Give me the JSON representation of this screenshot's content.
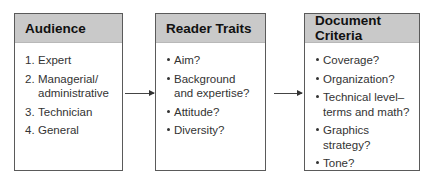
{
  "diagram": {
    "boxes": [
      {
        "title": "Audience",
        "list_type": "numbered",
        "items": [
          {
            "marker": "1.",
            "lines": [
              "Expert"
            ]
          },
          {
            "marker": "2.",
            "lines": [
              "Managerial/",
              "administrative"
            ]
          },
          {
            "marker": "3.",
            "lines": [
              "Technician"
            ]
          },
          {
            "marker": "4.",
            "lines": [
              "General"
            ]
          }
        ]
      },
      {
        "title": "Reader Traits",
        "list_type": "bullet",
        "items": [
          {
            "lines": [
              "Aim?"
            ]
          },
          {
            "lines": [
              "Background",
              "and expertise?"
            ]
          },
          {
            "lines": [
              "Attitude?"
            ]
          },
          {
            "lines": [
              "Diversity?"
            ]
          }
        ]
      },
      {
        "title": "Document Criteria",
        "list_type": "bullet",
        "items": [
          {
            "lines": [
              "Coverage?"
            ]
          },
          {
            "lines": [
              "Organization?"
            ]
          },
          {
            "lines": [
              "Technical level–",
              "terms and math?"
            ]
          },
          {
            "lines": [
              "Graphics strategy?"
            ]
          },
          {
            "lines": [
              "Tone?"
            ]
          }
        ]
      }
    ],
    "arrows": [
      {
        "from": "Audience",
        "to": "Reader Traits"
      },
      {
        "from": "Reader Traits",
        "to": "Document Criteria"
      }
    ],
    "colors": {
      "header_fill": "#c9c9c9",
      "border": "#5a5a5a",
      "text": "#333333"
    }
  }
}
